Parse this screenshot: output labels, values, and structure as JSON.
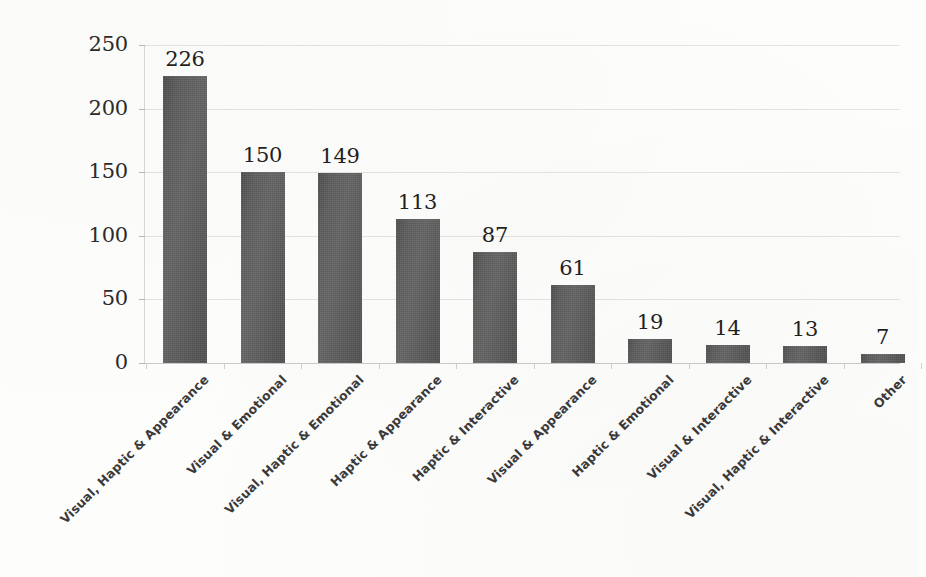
{
  "chart_data": {
    "type": "bar",
    "title": "",
    "subtitle": "",
    "xlabel": "",
    "ylabel": "",
    "ylim": [
      0,
      250
    ],
    "yticks": [
      0,
      50,
      100,
      150,
      200,
      250
    ],
    "ytick_labels": [
      "0",
      "50",
      "100",
      "150",
      "200",
      "250"
    ],
    "grid": true,
    "legend": false,
    "legend_position": "none",
    "orientation": "vertical",
    "bar_color": "#5b5b5b",
    "label_rotation": -45,
    "categories": [
      "Visual, Haptic & Appearance",
      "Visual & Emotional",
      "Visual, Haptic & Emotional",
      "Haptic & Appearance",
      "Haptic & Interactive",
      "Visual & Appearance",
      "Haptic & Emotional",
      "Visual & Interactive",
      "Visual, Haptic & Interactive",
      "Other"
    ],
    "values": [
      226,
      150,
      149,
      113,
      87,
      61,
      19,
      14,
      13,
      7
    ],
    "data_labels": [
      "226",
      "150",
      "149",
      "113",
      "87",
      "61",
      "19",
      "14",
      "13",
      "7"
    ]
  },
  "style": {
    "background_color": "#fdfdfc",
    "gridline_color": "#dedede",
    "axis_color": "#d8d8d8",
    "text_color": "#2b2b2b",
    "category_text_color": "#3a3a3a"
  },
  "caption": {
    "ghost_text": ""
  }
}
